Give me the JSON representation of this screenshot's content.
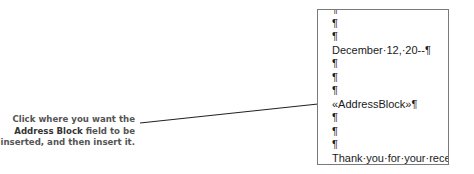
{
  "document": {
    "lines": [
      "¶",
      "¶",
      "¶",
      "December·12,·20--¶",
      "¶",
      "¶",
      "¶",
      "«AddressBlock»¶",
      "¶",
      "¶",
      "¶",
      "Thank·you·for·your·recent·"
    ]
  },
  "callout": {
    "line1": "Click where you want the",
    "line2_bold": "Address Block",
    "line2_rest": " field to be",
    "line3": "inserted, and then insert it."
  },
  "colors": {
    "border": "#7a7a7a",
    "callout_text": "#555555",
    "leader_line": "#222222"
  }
}
